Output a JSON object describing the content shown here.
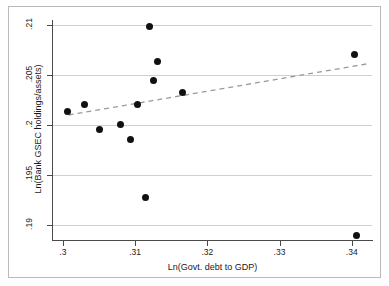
{
  "chart_data": {
    "type": "scatter",
    "title": "",
    "xlabel": "Ln(Govt. debt to GDP)",
    "ylabel": "Ln(Bank GSEC holdings/assets)",
    "xlim": [
      0.2985,
      0.3428
    ],
    "ylim": [
      0.1885,
      0.2105
    ],
    "xticks": [
      0.3,
      0.31,
      0.32,
      0.33,
      0.34
    ],
    "xticklabels": [
      ".3",
      ".31",
      ".32",
      ".33",
      ".34"
    ],
    "yticks": [
      0.19,
      0.195,
      0.2,
      0.205,
      0.21
    ],
    "yticklabels": [
      ".19",
      ".195",
      ".2",
      ".205",
      ".21"
    ],
    "grid": "horizontal",
    "legend": "none",
    "marker": "filled-circle",
    "marker_color": "#111111",
    "points": [
      {
        "x": 0.3007,
        "y": 0.2014
      },
      {
        "x": 0.303,
        "y": 0.2021
      },
      {
        "x": 0.3051,
        "y": 0.1996
      },
      {
        "x": 0.308,
        "y": 0.2001
      },
      {
        "x": 0.3094,
        "y": 0.1986
      },
      {
        "x": 0.3104,
        "y": 0.2021
      },
      {
        "x": 0.3115,
        "y": 0.1928
      },
      {
        "x": 0.312,
        "y": 0.2099
      },
      {
        "x": 0.3125,
        "y": 0.2045
      },
      {
        "x": 0.3131,
        "y": 0.2064
      },
      {
        "x": 0.3166,
        "y": 0.2033
      },
      {
        "x": 0.3404,
        "y": 0.2071
      },
      {
        "x": 0.3406,
        "y": 0.189
      }
    ],
    "series": [
      {
        "name": "fitted line",
        "type": "line",
        "style": "dashed",
        "color": "#9a9a9a",
        "x": [
          0.3008,
          0.342
        ],
        "y": [
          0.201,
          0.2061
        ]
      }
    ]
  }
}
